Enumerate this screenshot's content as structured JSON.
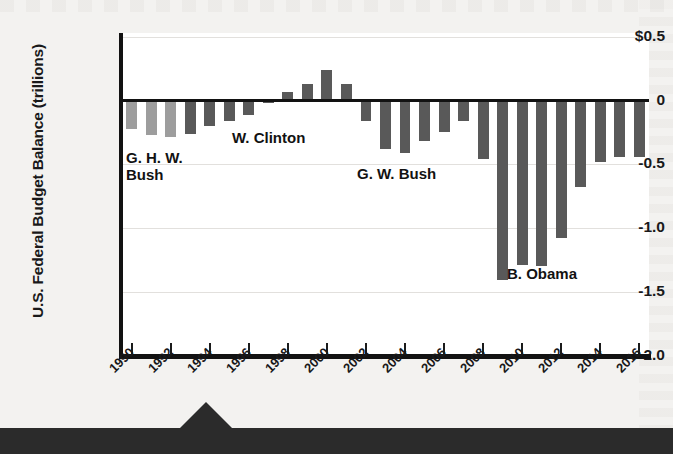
{
  "chart_data": {
    "type": "bar",
    "title": "",
    "xlabel": "",
    "ylabel": "U.S. Federal Budget Balance (trillions)",
    "ylim": [
      -2.0,
      0.5
    ],
    "grid": true,
    "legend": "none",
    "ytick_labels": [
      "$0.5",
      "0",
      "-0.5",
      "-1.0",
      "-1.5",
      "-2.0"
    ],
    "ytick_values": [
      0.5,
      0,
      -0.5,
      -1.0,
      -1.5,
      -2.0
    ],
    "xtick_labels": [
      "1990",
      "1992",
      "1994",
      "1996",
      "1998",
      "2000",
      "2002",
      "2004",
      "2006",
      "2008",
      "2010",
      "2012",
      "2014",
      "2016"
    ],
    "xtick_values": [
      1990,
      1992,
      1994,
      1996,
      1998,
      2000,
      2002,
      2004,
      2006,
      2008,
      2010,
      2012,
      2014,
      2016
    ],
    "categories": [
      1990,
      1991,
      1992,
      1993,
      1994,
      1995,
      1996,
      1997,
      1998,
      1999,
      2000,
      2001,
      2002,
      2003,
      2004,
      2005,
      2006,
      2007,
      2008,
      2009,
      2010,
      2011,
      2012,
      2013,
      2014,
      2015,
      2016
    ],
    "values": [
      -0.22,
      -0.27,
      -0.29,
      -0.26,
      -0.2,
      -0.16,
      -0.11,
      -0.02,
      0.07,
      0.13,
      0.24,
      0.13,
      -0.16,
      -0.38,
      -0.41,
      -0.32,
      -0.25,
      -0.16,
      -0.46,
      -1.41,
      -1.29,
      -1.3,
      -1.08,
      -0.68,
      -0.48,
      -0.44,
      -0.44
    ],
    "bar_colors": [
      "#9d9d9d",
      "#9d9d9d",
      "#9d9d9d",
      "#595959",
      "#595959",
      "#595959",
      "#595959",
      "#595959",
      "#595959",
      "#595959",
      "#595959",
      "#595959",
      "#595959",
      "#595959",
      "#595959",
      "#595959",
      "#595959",
      "#595959",
      "#595959",
      "#595959",
      "#595959",
      "#595959",
      "#595959",
      "#595959",
      "#595959",
      "#595959",
      "#595959"
    ],
    "annotations": [
      {
        "text": "G. H. W.\nBush",
        "x": 0.0,
        "y": -0.52
      },
      {
        "text": "W. Clinton",
        "x": 0.0,
        "y": -0.4
      },
      {
        "text": "G. W. Bush",
        "x": 0.0,
        "y": -0.6
      },
      {
        "text": "B. Obama",
        "x": 0.0,
        "y": -1.42
      }
    ],
    "colors": {
      "light_bar": "#9d9d9d",
      "dark_bar": "#595959",
      "axis": "#121212",
      "plot_background": "#ffffff",
      "page_background": "#f3f2f0",
      "caption_band": "#2b2b2b"
    }
  },
  "annotation_labels": {
    "ghw_bush": "G. H. W.\nBush",
    "clinton": "W. Clinton",
    "gw_bush": "G. W. Bush",
    "obama": "B. Obama"
  }
}
